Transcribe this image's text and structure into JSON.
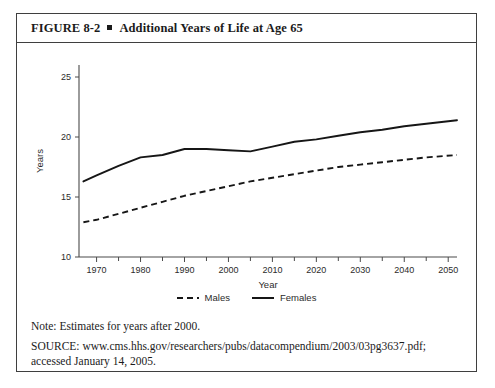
{
  "figure": {
    "label": "FIGURE 8-2",
    "bullet": "square-bullet",
    "title": "Additional Years of Life at Age 65"
  },
  "footnotes": {
    "note": "Note: Estimates for years after 2000.",
    "source_line1": "SOURCE: www.cms.hhs.gov/researchers/pubs/datacompendium/2003/03pg3637.pdf;",
    "source_line2": "accessed January 14, 2005."
  },
  "legend": {
    "items": [
      {
        "label": "Males",
        "style": "dashed"
      },
      {
        "label": "Females",
        "style": "solid"
      }
    ]
  },
  "chart_data": {
    "type": "line",
    "title": "Additional Years of Life at Age 65",
    "xlabel": "Year",
    "ylabel": "Years",
    "xlim": [
      1966,
      2052
    ],
    "ylim": [
      10,
      26
    ],
    "grid": false,
    "legend_position": "bottom-center",
    "x_major_ticks": [
      1970,
      1980,
      1990,
      2000,
      2010,
      2020,
      2030,
      2040,
      2050
    ],
    "x_minor_ticks": [
      1975,
      1985,
      1995,
      2005,
      2015,
      2025,
      2035,
      2045
    ],
    "x_tick_labels": [
      "1970",
      "1980",
      "1990",
      "2000",
      "2010",
      "2020",
      "2030",
      "2040",
      "2050"
    ],
    "y_ticks": [
      10,
      15,
      20,
      25
    ],
    "y_tick_labels": [
      "10",
      "15",
      "20",
      "25"
    ],
    "series": [
      {
        "name": "Females",
        "style": "solid",
        "color": "#161616",
        "x": [
          1967,
          1970,
          1975,
          1980,
          1985,
          1990,
          1995,
          2000,
          2005,
          2010,
          2015,
          2020,
          2025,
          2030,
          2035,
          2040,
          2045,
          2052
        ],
        "values": [
          16.3,
          16.8,
          17.6,
          18.3,
          18.5,
          19.0,
          19.0,
          18.9,
          18.8,
          19.2,
          19.6,
          19.8,
          20.1,
          20.4,
          20.6,
          20.9,
          21.1,
          21.4
        ]
      },
      {
        "name": "Males",
        "style": "dashed",
        "color": "#161616",
        "x": [
          1967,
          1970,
          1975,
          1980,
          1985,
          1990,
          1995,
          2000,
          2005,
          2010,
          2015,
          2020,
          2025,
          2030,
          2035,
          2040,
          2045,
          2052
        ],
        "values": [
          12.9,
          13.1,
          13.6,
          14.1,
          14.6,
          15.1,
          15.5,
          15.9,
          16.3,
          16.6,
          16.9,
          17.2,
          17.5,
          17.7,
          17.9,
          18.1,
          18.3,
          18.5
        ]
      }
    ]
  }
}
